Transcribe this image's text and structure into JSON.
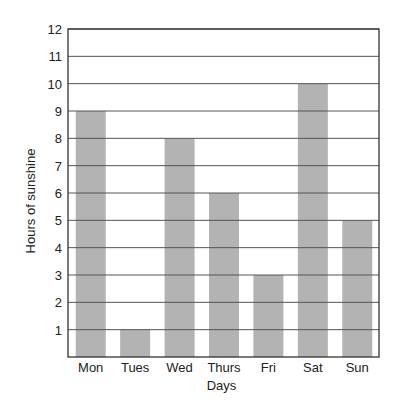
{
  "chart_data": {
    "type": "bar",
    "title": "",
    "xlabel": "Days",
    "ylabel": "Hours of sunshine",
    "categories": [
      "Mon",
      "Tues",
      "Wed",
      "Thurs",
      "Fri",
      "Sat",
      "Sun"
    ],
    "values": [
      9,
      1,
      8,
      6,
      3,
      10,
      5
    ],
    "ylim": [
      0,
      12
    ],
    "yticks": [
      1,
      2,
      3,
      4,
      5,
      6,
      7,
      8,
      9,
      10,
      11,
      12
    ],
    "grid": true,
    "legend": null,
    "bar_color": "#b3b3b3",
    "grid_color": "#555555",
    "axis_color": "#333333"
  }
}
